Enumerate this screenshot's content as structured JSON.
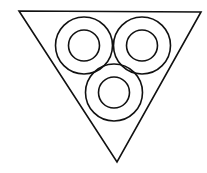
{
  "diagram": {
    "stroke_color": "#111111",
    "background": "#ffffff",
    "triangle": {
      "points": "19,11 201,12 117,162"
    },
    "rings": [
      {
        "id": "top-left",
        "cx": 84,
        "cy": 45.5,
        "outer_r": 28.5,
        "inner_r": 15.5
      },
      {
        "id": "top-right",
        "cx": 142,
        "cy": 45.5,
        "outer_r": 28.5,
        "inner_r": 15.5
      },
      {
        "id": "bottom",
        "cx": 114,
        "cy": 92.5,
        "outer_r": 28.5,
        "inner_r": 15.5
      }
    ]
  }
}
